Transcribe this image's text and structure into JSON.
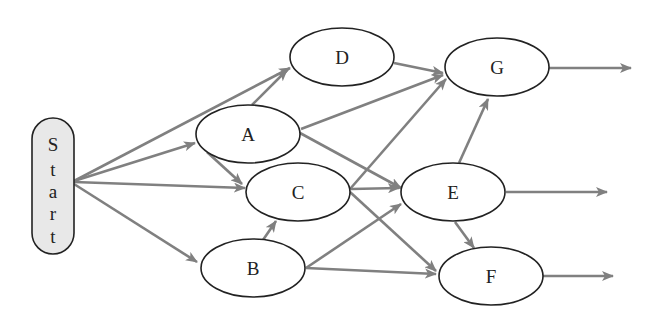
{
  "diagram": {
    "type": "flow-network",
    "colors": {
      "edge": "#808080",
      "node_stroke": "#222222",
      "node_fill": "#ffffff",
      "start_fill": "#e8e8e8"
    },
    "start": {
      "id": "start",
      "label": "Start",
      "letters": [
        "S",
        "t",
        "a",
        "r",
        "t"
      ]
    },
    "nodes": [
      {
        "id": "D",
        "label": "D"
      },
      {
        "id": "A",
        "label": "A"
      },
      {
        "id": "C",
        "label": "C"
      },
      {
        "id": "B",
        "label": "B"
      },
      {
        "id": "G",
        "label": "G"
      },
      {
        "id": "E",
        "label": "E"
      },
      {
        "id": "F",
        "label": "F"
      }
    ],
    "edges": [
      {
        "from": "Start",
        "to": "D"
      },
      {
        "from": "Start",
        "to": "A"
      },
      {
        "from": "Start",
        "to": "C"
      },
      {
        "from": "Start",
        "to": "B"
      },
      {
        "from": "A",
        "to": "D"
      },
      {
        "from": "A",
        "to": "C"
      },
      {
        "from": "A",
        "to": "G"
      },
      {
        "from": "A",
        "to": "E"
      },
      {
        "from": "D",
        "to": "G"
      },
      {
        "from": "C",
        "to": "G"
      },
      {
        "from": "C",
        "to": "E"
      },
      {
        "from": "C",
        "to": "F"
      },
      {
        "from": "B",
        "to": "C"
      },
      {
        "from": "B",
        "to": "E"
      },
      {
        "from": "B",
        "to": "F"
      },
      {
        "from": "E",
        "to": "G"
      },
      {
        "from": "E",
        "to": "F"
      },
      {
        "from": "G",
        "to": "exit"
      },
      {
        "from": "E",
        "to": "exit"
      },
      {
        "from": "F",
        "to": "exit"
      }
    ]
  }
}
